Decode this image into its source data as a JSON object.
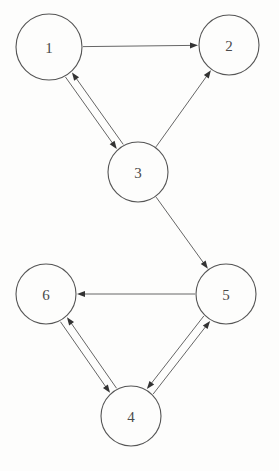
{
  "diagram": {
    "type": "directed-graph",
    "width": 279,
    "height": 471,
    "background_color": "#fdfdfc",
    "node_stroke_color": "#555555",
    "edge_stroke_color": "#666666",
    "arrow_color": "#333333",
    "label_color": "#4a4a4a",
    "node_radius": 30,
    "nodes": [
      {
        "id": "1",
        "label": "1",
        "cx": 49,
        "cy": 47,
        "r": 33
      },
      {
        "id": "2",
        "label": "2",
        "cx": 229,
        "cy": 45,
        "r": 30
      },
      {
        "id": "3",
        "label": "3",
        "cx": 138,
        "cy": 172,
        "r": 30
      },
      {
        "id": "4",
        "label": "4",
        "cx": 131,
        "cy": 416,
        "r": 30
      },
      {
        "id": "5",
        "label": "5",
        "cx": 226,
        "cy": 294,
        "r": 30
      },
      {
        "id": "6",
        "label": "6",
        "cx": 46,
        "cy": 294,
        "r": 30
      }
    ],
    "edges": [
      {
        "from": "1",
        "to": "2",
        "directed": true,
        "offset": 0
      },
      {
        "from": "1",
        "to": "3",
        "directed": true,
        "offset": 4
      },
      {
        "from": "3",
        "to": "1",
        "directed": true,
        "offset": 4
      },
      {
        "from": "3",
        "to": "2",
        "directed": true,
        "offset": 0
      },
      {
        "from": "3",
        "to": "5",
        "directed": true,
        "offset": 0
      },
      {
        "from": "5",
        "to": "6",
        "directed": true,
        "offset": 0
      },
      {
        "from": "6",
        "to": "4",
        "directed": true,
        "offset": 4
      },
      {
        "from": "4",
        "to": "6",
        "directed": true,
        "offset": 4
      },
      {
        "from": "5",
        "to": "4",
        "directed": true,
        "offset": 4
      },
      {
        "from": "4",
        "to": "5",
        "directed": true,
        "offset": 4
      }
    ]
  }
}
